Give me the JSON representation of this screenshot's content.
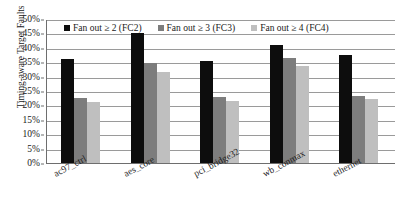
{
  "chart_data": {
    "type": "bar",
    "title": "",
    "xlabel": "",
    "ylabel": "Timing-aware Target Faults",
    "ylim": [
      0,
      50
    ],
    "y_unit": "%",
    "grid": true,
    "legend_position": "top-inside",
    "categories": [
      "ac97_ctrl",
      "aes_core",
      "pci_bridge32",
      "wb_conmax",
      "ethernet"
    ],
    "y_ticks": [
      "0%",
      "5%",
      "10%",
      "15%",
      "20%",
      "25%",
      "30%",
      "35%",
      "40%",
      "45%",
      "50%"
    ],
    "y_tick_values": [
      0,
      5,
      10,
      15,
      20,
      25,
      30,
      35,
      40,
      45,
      50
    ],
    "series": [
      {
        "name": "Fan out ≥ 2 (FC2)",
        "color": "#0d0d0d",
        "values": [
          36.1,
          45.1,
          35.5,
          41.0,
          37.5
        ]
      },
      {
        "name": "Fan out ≥ 3 (FC3)",
        "color": "#7d7d7d",
        "values": [
          22.7,
          34.8,
          23.0,
          36.3,
          23.3
        ]
      },
      {
        "name": "Fan out ≥ 4 (FC4)",
        "color": "#bfbfbf",
        "values": [
          21.3,
          31.7,
          21.4,
          33.8,
          22.4
        ]
      }
    ]
  },
  "axis": {
    "y_title": "Timing-aware Target Faults"
  },
  "legend": {
    "items": [
      {
        "label": "Fan out ≥ 2 (FC2)",
        "key": "fc2"
      },
      {
        "label": "Fan out ≥ 3 (FC3)",
        "key": "fc3"
      },
      {
        "label": "Fan out ≥ 4 (FC4)",
        "key": "fc4"
      }
    ]
  }
}
